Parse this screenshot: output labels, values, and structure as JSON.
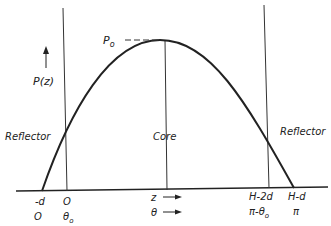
{
  "diagram": {
    "type": "power-distribution",
    "axis_labels": {
      "y": "P(z)",
      "peak": "P",
      "peak_sub": "o"
    },
    "regions": {
      "left": "Reflector",
      "center": "Core",
      "right": "Reflector"
    },
    "z_ticks": {
      "neg_d": "-d",
      "zero": "O",
      "z": "z",
      "h2d": "H-2d",
      "hd": "H-d"
    },
    "theta_ticks": {
      "zero": "O",
      "theta0": "θ",
      "theta0_sub": "o",
      "theta": "θ",
      "pi_minus": "π-θ",
      "pi_minus_sub": "o",
      "pi": "π"
    }
  }
}
